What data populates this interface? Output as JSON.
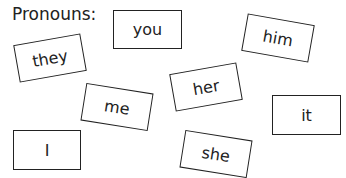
{
  "title": "Pronouns:",
  "cards": [
    {
      "word": "you"
    },
    {
      "word": "they"
    },
    {
      "word": "him"
    },
    {
      "word": "me"
    },
    {
      "word": "her"
    },
    {
      "word": "it"
    },
    {
      "word": "I"
    },
    {
      "word": "she"
    }
  ]
}
